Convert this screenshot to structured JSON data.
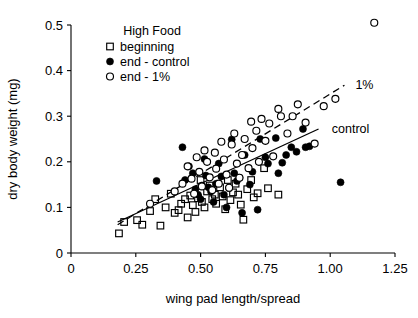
{
  "chart_data": {
    "type": "scatter",
    "title": "",
    "xlabel": "wing pad length/spread",
    "ylabel": "dry body weight (mg)",
    "xlim": [
      0,
      1.25
    ],
    "ylim": [
      0,
      0.5
    ],
    "xticks": [
      0,
      0.25,
      0.5,
      0.75,
      1.0,
      1.25
    ],
    "xtick_labels": [
      "0",
      "0.25",
      "0.50",
      "0.75",
      "1.00",
      "1.25"
    ],
    "yticks": [
      0,
      0.1,
      0.2,
      0.3,
      0.4,
      0.5
    ],
    "ytick_labels": [
      "0",
      "0.1",
      "0.2",
      "0.3",
      "0.4",
      "0.5"
    ],
    "grid": false,
    "legend_title": "High Food",
    "legend_position": "top-left-inside",
    "series": [
      {
        "name": "beginning",
        "marker": "open-square",
        "points": [
          [
            0.185,
            0.043
          ],
          [
            0.205,
            0.068
          ],
          [
            0.255,
            0.072
          ],
          [
            0.275,
            0.062
          ],
          [
            0.305,
            0.092
          ],
          [
            0.325,
            0.118
          ],
          [
            0.345,
            0.06
          ],
          [
            0.365,
            0.1
          ],
          [
            0.385,
            0.13
          ],
          [
            0.4,
            0.088
          ],
          [
            0.415,
            0.094
          ],
          [
            0.425,
            0.108
          ],
          [
            0.44,
            0.118
          ],
          [
            0.45,
            0.078
          ],
          [
            0.46,
            0.126
          ],
          [
            0.47,
            0.105
          ],
          [
            0.48,
            0.09
          ],
          [
            0.49,
            0.12
          ],
          [
            0.5,
            0.16
          ],
          [
            0.505,
            0.112
          ],
          [
            0.515,
            0.1
          ],
          [
            0.525,
            0.135
          ],
          [
            0.535,
            0.148
          ],
          [
            0.545,
            0.118
          ],
          [
            0.555,
            0.128
          ],
          [
            0.56,
            0.108
          ],
          [
            0.575,
            0.144
          ],
          [
            0.585,
            0.124
          ],
          [
            0.595,
            0.096
          ],
          [
            0.605,
            0.16
          ],
          [
            0.615,
            0.116
          ],
          [
            0.625,
            0.133
          ],
          [
            0.635,
            0.152
          ],
          [
            0.645,
            0.128
          ],
          [
            0.655,
            0.106
          ],
          [
            0.665,
            0.073
          ],
          [
            0.68,
            0.14
          ],
          [
            0.695,
            0.16
          ],
          [
            0.705,
            0.122
          ],
          [
            0.72,
            0.131
          ],
          [
            0.745,
            0.186
          ],
          [
            0.76,
            0.142
          ],
          [
            0.8,
            0.128
          ]
        ]
      },
      {
        "name": "end - control",
        "marker": "filled-circle",
        "points": [
          [
            0.33,
            0.158
          ],
          [
            0.43,
            0.232
          ],
          [
            0.44,
            0.16
          ],
          [
            0.455,
            0.19
          ],
          [
            0.47,
            0.175
          ],
          [
            0.48,
            0.14
          ],
          [
            0.49,
            0.128
          ],
          [
            0.5,
            0.118
          ],
          [
            0.505,
            0.148
          ],
          [
            0.515,
            0.206
          ],
          [
            0.52,
            0.17
          ],
          [
            0.53,
            0.144
          ],
          [
            0.54,
            0.135
          ],
          [
            0.55,
            0.112
          ],
          [
            0.56,
            0.152
          ],
          [
            0.57,
            0.196
          ],
          [
            0.58,
            0.168
          ],
          [
            0.59,
            0.128
          ],
          [
            0.6,
            0.1
          ],
          [
            0.61,
            0.142
          ],
          [
            0.62,
            0.249
          ],
          [
            0.63,
            0.175
          ],
          [
            0.64,
            0.158
          ],
          [
            0.65,
            0.165
          ],
          [
            0.66,
            0.088
          ],
          [
            0.67,
            0.215
          ],
          [
            0.69,
            0.15
          ],
          [
            0.7,
            0.178
          ],
          [
            0.72,
            0.095
          ],
          [
            0.73,
            0.25
          ],
          [
            0.75,
            0.21
          ],
          [
            0.76,
            0.196
          ],
          [
            0.79,
            0.252
          ],
          [
            0.8,
            0.175
          ],
          [
            0.815,
            0.198
          ],
          [
            0.83,
            0.215
          ],
          [
            0.85,
            0.232
          ],
          [
            0.87,
            0.222
          ],
          [
            0.895,
            0.272
          ],
          [
            0.905,
            0.232
          ],
          [
            0.92,
            0.234
          ],
          [
            1.04,
            0.155
          ]
        ]
      },
      {
        "name": "end - 1%",
        "marker": "open-circle",
        "points": [
          [
            0.305,
            0.108
          ],
          [
            0.4,
            0.135
          ],
          [
            0.43,
            0.152
          ],
          [
            0.45,
            0.19
          ],
          [
            0.465,
            0.163
          ],
          [
            0.475,
            0.13
          ],
          [
            0.485,
            0.21
          ],
          [
            0.495,
            0.178
          ],
          [
            0.505,
            0.146
          ],
          [
            0.515,
            0.225
          ],
          [
            0.525,
            0.2
          ],
          [
            0.535,
            0.166
          ],
          [
            0.545,
            0.138
          ],
          [
            0.555,
            0.22
          ],
          [
            0.56,
            0.185
          ],
          [
            0.57,
            0.152
          ],
          [
            0.58,
            0.244
          ],
          [
            0.59,
            0.205
          ],
          [
            0.6,
            0.172
          ],
          [
            0.61,
            0.143
          ],
          [
            0.62,
            0.238
          ],
          [
            0.63,
            0.262
          ],
          [
            0.64,
            0.196
          ],
          [
            0.65,
            0.165
          ],
          [
            0.66,
            0.215
          ],
          [
            0.67,
            0.25
          ],
          [
            0.685,
            0.186
          ],
          [
            0.695,
            0.288
          ],
          [
            0.7,
            0.23
          ],
          [
            0.715,
            0.268
          ],
          [
            0.725,
            0.2
          ],
          [
            0.735,
            0.294
          ],
          [
            0.75,
            0.246
          ],
          [
            0.765,
            0.284
          ],
          [
            0.78,
            0.212
          ],
          [
            0.8,
            0.316
          ],
          [
            0.81,
            0.3
          ],
          [
            0.835,
            0.262
          ],
          [
            0.855,
            0.3
          ],
          [
            0.875,
            0.326
          ],
          [
            0.905,
            0.286
          ],
          [
            0.94,
            0.24
          ],
          [
            0.975,
            0.322
          ],
          [
            1.02,
            0.338
          ],
          [
            1.17,
            0.505
          ]
        ]
      }
    ],
    "trend_lines": [
      {
        "name": "1%",
        "style": "dashed",
        "label": "1%",
        "x0": 0.18,
        "y0": 0.062,
        "x1": 1.055,
        "y1": 0.368
      },
      {
        "name": "control",
        "style": "solid",
        "label": "control",
        "x0": 0.18,
        "y0": 0.068,
        "x1": 0.955,
        "y1": 0.272
      }
    ]
  }
}
